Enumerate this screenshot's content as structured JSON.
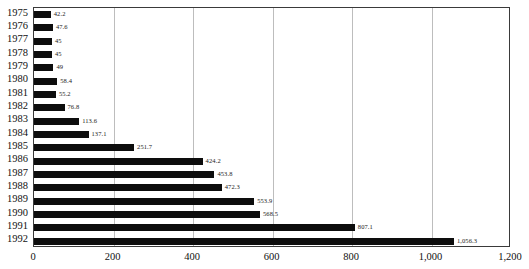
{
  "chart_data": {
    "type": "bar",
    "orientation": "horizontal",
    "title": "",
    "subtitle": "",
    "xlabel": "",
    "ylabel": "",
    "xlim": [
      0,
      1200
    ],
    "ylim": null,
    "grid": true,
    "legend": null,
    "legend_position": "none",
    "bar_color": "#0d0d0d",
    "gridline_color": "#bdbdbd",
    "frame_color": "#3a3a3a",
    "xticks": [
      0,
      200,
      400,
      600,
      800,
      1000,
      1200
    ],
    "xtick_labels": [
      "0",
      "200",
      "400",
      "600",
      "800",
      "1,000",
      "1,200"
    ],
    "categories": [
      "1975",
      "1976",
      "1977",
      "1978",
      "1979",
      "1980",
      "1981",
      "1982",
      "1983",
      "1984",
      "1985",
      "1986",
      "1987",
      "1988",
      "1989",
      "1990",
      "1991",
      "1992"
    ],
    "values": [
      42.2,
      47.6,
      45,
      45,
      49,
      58.4,
      55.2,
      76.8,
      113.6,
      137.1,
      251.7,
      424.2,
      453.8,
      472.3,
      553.9,
      568.5,
      807.1,
      1056.3
    ],
    "value_labels": [
      "42.2",
      "47.6",
      "45",
      "45",
      "49",
      "58.4",
      "55.2",
      "76.8",
      "113.6",
      "137.1",
      "251.7",
      "424.2",
      "453.8",
      "472.3",
      "553.9",
      "568.5",
      "807.1",
      "1,056.3"
    ]
  }
}
